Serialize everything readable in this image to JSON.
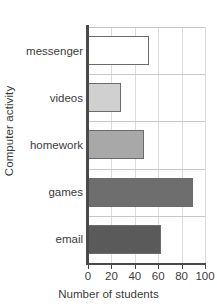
{
  "chart_data": {
    "type": "bar",
    "orientation": "horizontal",
    "title": "",
    "xlabel": "Number of students",
    "ylabel": "Computer activity",
    "categories": [
      "messenger",
      "videos",
      "homework",
      "games",
      "email"
    ],
    "values": [
      52,
      28,
      48,
      90,
      62
    ],
    "bar_colors": [
      "#ffffff",
      "#d0d0d0",
      "#a8a8a8",
      "#6e6e6e",
      "#5a5a5a"
    ],
    "bar_edge_color": "#6b6b6b",
    "xlim": [
      0,
      100
    ],
    "xticks": [
      0,
      20,
      40,
      60,
      80,
      100
    ],
    "xtick_labels": [
      "0",
      "20",
      "40",
      "60",
      "80",
      "100"
    ],
    "grid": true,
    "grid_color": "#dcdcdc",
    "legend": null,
    "axis_color": "#4a4a4a"
  }
}
